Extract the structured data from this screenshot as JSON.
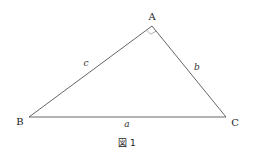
{
  "figure": {
    "caption": "図 1",
    "caption_prefix": "図",
    "caption_number": "1",
    "vertices": {
      "A": {
        "label": "A",
        "x": 152,
        "y": 26
      },
      "B": {
        "label": "B",
        "x": 29,
        "y": 117
      },
      "C": {
        "label": "C",
        "x": 226,
        "y": 117
      }
    },
    "sides": {
      "a": {
        "label": "a",
        "from": "B",
        "to": "C"
      },
      "b": {
        "label": "b",
        "from": "A",
        "to": "C"
      },
      "c": {
        "label": "c",
        "from": "A",
        "to": "B"
      }
    },
    "right_angle_at": "A",
    "colors": {
      "line": "#555555",
      "right_angle_mark": "#9a9a9a",
      "background": "#ffffff"
    }
  }
}
